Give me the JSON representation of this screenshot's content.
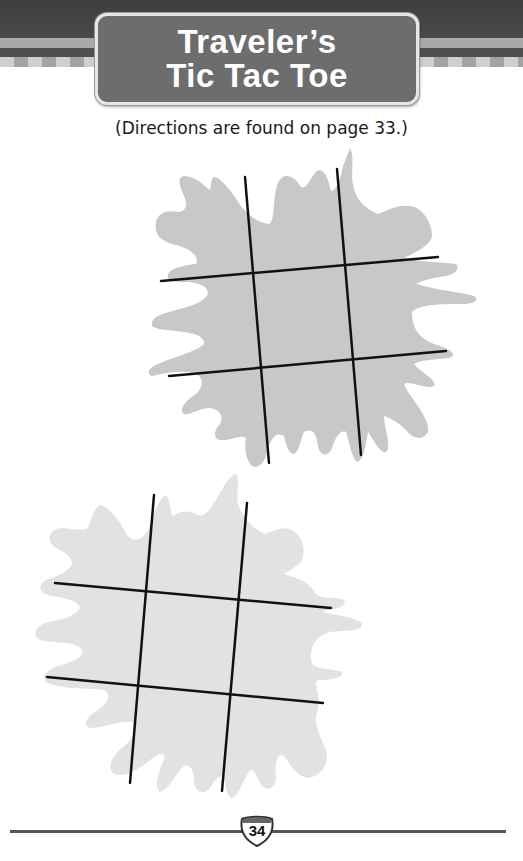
{
  "header": {
    "title_lines": [
      "Traveler’s",
      "Tic Tac Toe"
    ]
  },
  "directions": "(Directions are found on page 33.)",
  "boards": [
    {
      "id": "board-1",
      "splat_color": "#c8c8c8",
      "line_color": "#111111"
    },
    {
      "id": "board-2",
      "splat_color": "#e2e2e2",
      "line_color": "#111111"
    }
  ],
  "footer": {
    "page_number": "34",
    "icon": "interstate-shield-icon"
  }
}
